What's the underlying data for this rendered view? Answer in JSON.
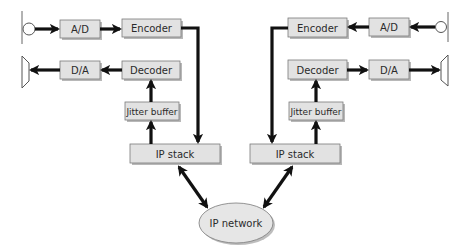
{
  "diagram": {
    "colors": {
      "box_fill": "#e2e2e2",
      "box_border": "#7a7a7a",
      "arrow": "#111111",
      "network_fill": "#e6e6e6"
    },
    "left_endpoint": {
      "microphone": {
        "icon": "microphone-icon"
      },
      "speaker": {
        "icon": "speaker-icon"
      },
      "ad": {
        "label": "A/D"
      },
      "encoder": {
        "label": "Encoder"
      },
      "da": {
        "label": "D/A"
      },
      "decoder": {
        "label": "Decoder"
      },
      "jitter_buffer": {
        "label": "Jitter buffer"
      },
      "ip_stack": {
        "label": "IP stack"
      }
    },
    "right_endpoint": {
      "microphone": {
        "icon": "microphone-icon"
      },
      "speaker": {
        "icon": "speaker-icon"
      },
      "ad": {
        "label": "A/D"
      },
      "encoder": {
        "label": "Encoder"
      },
      "da": {
        "label": "D/A"
      },
      "decoder": {
        "label": "Decoder"
      },
      "jitter_buffer": {
        "label": "Jitter buffer"
      },
      "ip_stack": {
        "label": "IP stack"
      }
    },
    "network": {
      "label": "IP network"
    },
    "connections": [
      {
        "from": "left microphone",
        "to": "left A/D"
      },
      {
        "from": "left A/D",
        "to": "left Encoder"
      },
      {
        "from": "left Encoder",
        "to": "left IP stack"
      },
      {
        "from": "left IP stack",
        "to": "left Jitter buffer"
      },
      {
        "from": "left Jitter buffer",
        "to": "left Decoder"
      },
      {
        "from": "left Decoder",
        "to": "left D/A"
      },
      {
        "from": "left D/A",
        "to": "left speaker"
      },
      {
        "from": "left IP stack",
        "to": "IP network",
        "bidirectional": true
      },
      {
        "from": "right IP stack",
        "to": "IP network",
        "bidirectional": true
      },
      {
        "from": "right microphone",
        "to": "right A/D"
      },
      {
        "from": "right A/D",
        "to": "right Encoder"
      },
      {
        "from": "right Encoder",
        "to": "right IP stack"
      },
      {
        "from": "right IP stack",
        "to": "right Jitter buffer"
      },
      {
        "from": "right Jitter buffer",
        "to": "right Decoder"
      },
      {
        "from": "right Decoder",
        "to": "right D/A"
      },
      {
        "from": "right D/A",
        "to": "right speaker"
      }
    ]
  }
}
